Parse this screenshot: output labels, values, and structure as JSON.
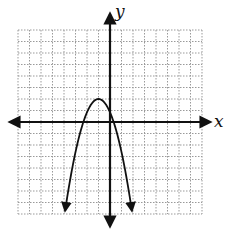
{
  "chart_data": {
    "type": "line",
    "title": "",
    "xlabel": "x",
    "ylabel": "y",
    "grid": true,
    "xlim": [
      -8,
      8
    ],
    "ylim": [
      -8,
      8
    ],
    "series": [
      {
        "name": "parabola",
        "equation_approx": "y = -(x + 1)^2 + 2",
        "vertex": [
          -1,
          2
        ],
        "x_intercepts_approx": [
          -2.4,
          0.4
        ],
        "y_intercept_approx": 1,
        "opens": "down",
        "x": [
          -3.9,
          -3,
          -2.4,
          -2,
          -1,
          0,
          0.4,
          1,
          2.2
        ],
        "y": [
          -7.7,
          -2,
          0,
          1,
          2,
          1,
          0,
          -2,
          -7.7
        ]
      }
    ]
  },
  "labels": {
    "x_axis": "x",
    "y_axis": "y"
  },
  "colors": {
    "axis": "#111111",
    "grid": "#9a9a9a",
    "curve": "#111111"
  }
}
